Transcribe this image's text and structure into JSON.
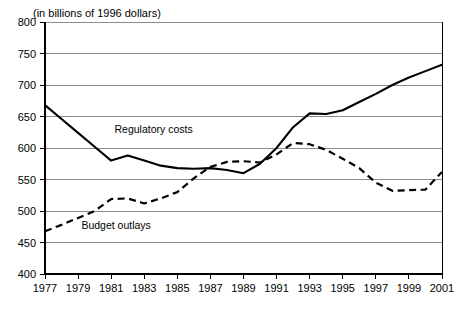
{
  "chart_data": {
    "type": "line",
    "title": "(in billions of 1996 dollars)",
    "xlabel": "",
    "ylabel": "",
    "xlim": [
      1977,
      2001
    ],
    "ylim": [
      400,
      800
    ],
    "grid": true,
    "legend_position": "inline-annotation",
    "y_ticks": [
      400,
      450,
      500,
      550,
      600,
      650,
      700,
      750,
      800
    ],
    "x_ticks": [
      1977,
      1979,
      1981,
      1983,
      1985,
      1987,
      1989,
      1991,
      1993,
      1995,
      1997,
      1999,
      2001
    ],
    "x": [
      1977,
      1978,
      1979,
      1980,
      1981,
      1982,
      1983,
      1984,
      1985,
      1986,
      1987,
      1988,
      1989,
      1990,
      1991,
      1992,
      1993,
      1994,
      1995,
      1996,
      1997,
      1998,
      1999,
      2000,
      2001
    ],
    "series": [
      {
        "name": "Regulatory costs",
        "style": "solid",
        "values": [
          668,
          646,
          624,
          602,
          580,
          588,
          580,
          572,
          568,
          567,
          568,
          565,
          560,
          575,
          600,
          633,
          655,
          654,
          660,
          673,
          686,
          700,
          712,
          722,
          732
        ]
      },
      {
        "name": "Budget outlays",
        "style": "dashed",
        "values": [
          468,
          478,
          489,
          500,
          519,
          520,
          512,
          520,
          530,
          552,
          570,
          578,
          579,
          577,
          590,
          608,
          606,
          597,
          583,
          568,
          545,
          532,
          533,
          534,
          562
        ]
      }
    ],
    "annotations": [
      {
        "text": "Regulatory costs",
        "x": 1981.2,
        "y": 624
      },
      {
        "text": "Budget outlays",
        "x": 1979.2,
        "y": 472
      }
    ],
    "colors": {
      "series_line": "#000000",
      "gridline": "#8c8c8c",
      "axis": "#000000",
      "background": "#ffffff"
    }
  }
}
